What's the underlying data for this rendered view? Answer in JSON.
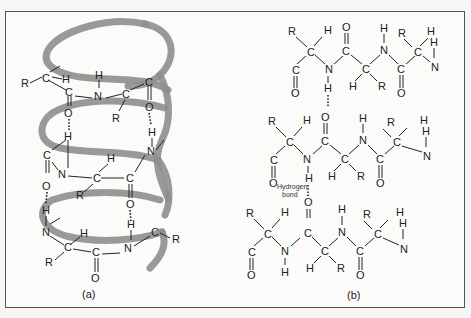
{
  "figure": {
    "panel_a": {
      "caption": "(a)",
      "description": "Alpha helix: polypeptide backbone coiled along a helical ribbon with intrachain hydrogen bonds",
      "atoms": [
        "R",
        "C",
        "H",
        "C",
        "O",
        "N",
        "H",
        "C",
        "R",
        "C",
        "O",
        "H",
        "N",
        "C",
        "N",
        "O",
        "H",
        "C",
        "C",
        "R",
        "H",
        "O",
        "H",
        "N",
        "C",
        "R",
        "H",
        "C",
        "O",
        "N",
        "C",
        "R"
      ]
    },
    "panel_b": {
      "caption": "(b)",
      "description": "Beta pleated sheet: three parallel polypeptide strands joined by interchain hydrogen bonds",
      "annotation": "Hydrogen bond",
      "annotation_line1": "Hydrogen",
      "annotation_line2": "bond",
      "strands": [
        {
          "atoms": [
            "R",
            "H",
            "C",
            "C",
            "O",
            "N",
            "C",
            "O",
            "H",
            "N",
            "C",
            "H",
            "R",
            "C",
            "O",
            "R",
            "H",
            "H",
            "N"
          ]
        },
        {
          "atoms": [
            "R",
            "H",
            "C",
            "C",
            "O",
            "N",
            "H",
            "C",
            "O",
            "H",
            "N",
            "C",
            "H",
            "R",
            "C",
            "O",
            "R",
            "H",
            "H",
            "N"
          ]
        },
        {
          "atoms": [
            "R",
            "H",
            "C",
            "C",
            "O",
            "N",
            "H",
            "C",
            "O",
            "H",
            "N",
            "C",
            "H",
            "R",
            "C",
            "O",
            "R",
            "H",
            "H",
            "N"
          ]
        }
      ]
    },
    "colors": {
      "ribbon": "#8e8e8e",
      "ink": "#222222",
      "frame": "#555555",
      "background": "#fbfbfa"
    }
  },
  "labels": {
    "R": "R",
    "H": "H",
    "C": "C",
    "N": "N",
    "O": "O"
  }
}
